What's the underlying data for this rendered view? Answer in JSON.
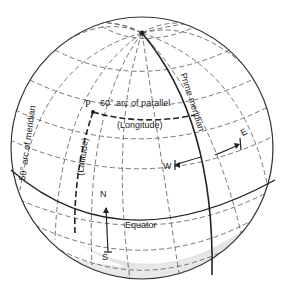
{
  "diagram": {
    "type": "globe-graticule",
    "labels": {
      "point_p": "P",
      "parallel_arc": "60° arc of parallel",
      "parallel_arc_sub": "(Longitude)",
      "meridian_arc": "50° arc of meridian",
      "meridian_arc_sub": "(Latitude)",
      "prime_meridian": "Prime meridian",
      "equator": "Equator",
      "north": "N",
      "south": "S",
      "west": "W",
      "east": "E"
    },
    "colors": {
      "outline": "#333333",
      "grid": "#555555",
      "shade": "#e2e2e2",
      "background": "#ffffff"
    }
  }
}
